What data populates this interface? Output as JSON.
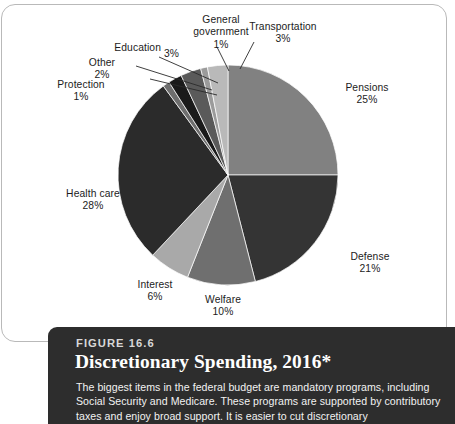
{
  "figure": {
    "number_label": "FIGURE 16.6",
    "title": "Discretionary Spending, 2016*",
    "body": "The biggest items in the federal budget are mandatory programs, including Social Security and Medicare. These programs are supported by contributory taxes and enjoy broad support. It is easier to cut discretionary"
  },
  "chart_data": {
    "type": "pie",
    "title": "Discretionary Spending, 2016*",
    "unit": "percent",
    "legend": "none",
    "start_angle_deg": 0,
    "direction": "clockwise",
    "categories": [
      "Pensions",
      "Defense",
      "Welfare",
      "Interest",
      "Health care",
      "Protection",
      "Other",
      "Education",
      "General government",
      "Transportation"
    ],
    "values": [
      25,
      21,
      10,
      6,
      28,
      1,
      2,
      3,
      1,
      3
    ],
    "colors": [
      "#818181",
      "#343434",
      "#6f6f6f",
      "#a9a9a9",
      "#2b2b2b",
      "#6e6e6e",
      "#1a1a1a",
      "#5a5a5a",
      "#9b9b9b",
      "#b9b9b9"
    ],
    "slices": [
      {
        "name": "Pensions",
        "value": 25,
        "label": "Pensions",
        "pct_label": "25%",
        "color": "#818181",
        "leader": false
      },
      {
        "name": "Defense",
        "value": 21,
        "label": "Defense",
        "pct_label": "21%",
        "color": "#343434",
        "leader": false
      },
      {
        "name": "Welfare",
        "value": 10,
        "label": "Welfare",
        "pct_label": "10%",
        "color": "#6f6f6f",
        "leader": false
      },
      {
        "name": "Interest",
        "value": 6,
        "label": "Interest",
        "pct_label": "6%",
        "color": "#a9a9a9",
        "leader": false
      },
      {
        "name": "Health care",
        "value": 28,
        "label": "Health care",
        "pct_label": "28%",
        "color": "#2b2b2b",
        "leader": false
      },
      {
        "name": "Protection",
        "value": 1,
        "label": "Protection",
        "pct_label": "1%",
        "color": "#6e6e6e",
        "leader": true
      },
      {
        "name": "Other",
        "value": 2,
        "label": "Other",
        "pct_label": "2%",
        "color": "#1a1a1a",
        "leader": true
      },
      {
        "name": "Education",
        "value": 3,
        "label": "Education",
        "pct_label": "3%",
        "color": "#5a5a5a",
        "leader": true
      },
      {
        "name": "General government",
        "value": 1,
        "label_line1": "General",
        "label_line2": "government",
        "pct_label": "1%",
        "color": "#9b9b9b",
        "leader": true
      },
      {
        "name": "Transportation",
        "value": 3,
        "label": "Transportation",
        "pct_label": "3%",
        "color": "#b9b9b9",
        "leader": true
      }
    ]
  }
}
